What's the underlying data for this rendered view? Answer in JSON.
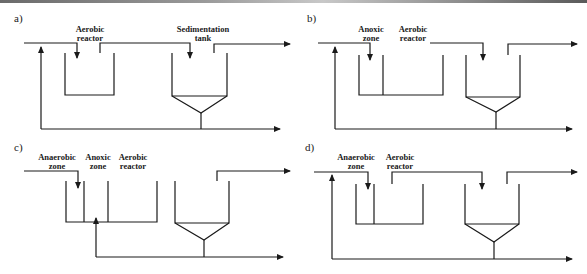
{
  "figure": {
    "panels": [
      {
        "id": "a",
        "label": "a)",
        "units": [
          {
            "name": "aerobic-reactor",
            "line1": "Aerobic",
            "line2": "reactor"
          },
          {
            "name": "sedimentation-tank",
            "line1": "Sedimentation",
            "line2": "tank"
          }
        ]
      },
      {
        "id": "b",
        "label": "b)",
        "units": [
          {
            "name": "anoxic-zone",
            "line1": "Anoxic",
            "line2": "zone"
          },
          {
            "name": "aerobic-reactor",
            "line1": "Aerobic",
            "line2": "reactor"
          }
        ]
      },
      {
        "id": "c",
        "label": "c)",
        "units": [
          {
            "name": "anaerobic-zone",
            "line1": "Anaerobic",
            "line2": "zone"
          },
          {
            "name": "anoxic-zone",
            "line1": "Anoxic",
            "line2": "zone"
          },
          {
            "name": "aerobic-reactor",
            "line1": "Aerobic",
            "line2": "reactor"
          }
        ]
      },
      {
        "id": "d",
        "label": "d)",
        "units": [
          {
            "name": "anaerobic-zone",
            "line1": "Anaerobic",
            "line2": "zone"
          },
          {
            "name": "aerobic-reactor",
            "line1": "Aerobic",
            "line2": "reactor"
          }
        ]
      }
    ],
    "colors": {
      "line": "#1a1a1a",
      "background": "#ffffff"
    }
  }
}
